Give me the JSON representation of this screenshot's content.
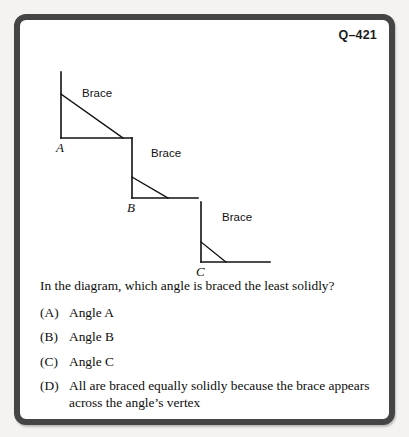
{
  "header": {
    "question_code": "Q–421"
  },
  "diagram": {
    "brace_label": "Brace",
    "angles": [
      {
        "vertex_label": "A",
        "brace_label": "Brace",
        "vertex_x": 41,
        "vertex_y": 94,
        "arm_top_y": 28,
        "arm_right_x": 112,
        "brace_start_y": 50,
        "brace_end_x": 103,
        "label_x": 36,
        "label_y": 97,
        "brace_text_x": 62,
        "brace_text_y": 44
      },
      {
        "vertex_label": "B",
        "brace_label": "Brace",
        "vertex_x": 112,
        "vertex_y": 154,
        "arm_top_y": 94,
        "arm_right_x": 178,
        "brace_start_y": 133,
        "brace_end_x": 148,
        "label_x": 107,
        "label_y": 157,
        "brace_text_x": 131,
        "brace_text_y": 104
      },
      {
        "vertex_label": "C",
        "brace_label": "Brace",
        "vertex_x": 181,
        "vertex_y": 218,
        "arm_top_y": 158,
        "arm_right_x": 250,
        "brace_start_y": 198,
        "brace_end_x": 206,
        "label_x": 176,
        "label_y": 221,
        "brace_text_x": 202,
        "brace_text_y": 168
      }
    ]
  },
  "question": {
    "stem": "In the diagram, which angle is braced the least solidly?",
    "options": [
      {
        "marker": "(A)",
        "text": "Angle A"
      },
      {
        "marker": "(B)",
        "text": "Angle B"
      },
      {
        "marker": "(C)",
        "text": "Angle C"
      },
      {
        "marker": "(D)",
        "text": "All are braced equally solidly because the brace appears across the angle’s vertex"
      }
    ]
  },
  "colors": {
    "frame": "#454545",
    "page": "#f4f3f1",
    "card": "#ffffff",
    "ink": "#111111"
  }
}
